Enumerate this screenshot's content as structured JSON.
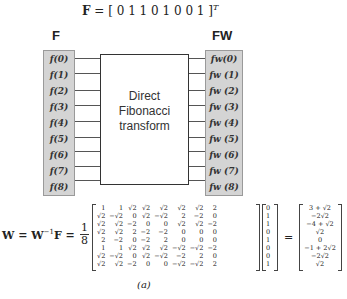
{
  "top_formula": {
    "lhs": "F",
    "eq": " = [ ",
    "values": "0 1 1 0 1 0 0 1",
    "close": " ]",
    "superscript": "T"
  },
  "left_column": {
    "label": "F",
    "cells": [
      "f(0)",
      "f(1)",
      "f(2)",
      "f(3)",
      "f(4)",
      "f(5)",
      "f(6)",
      "f(7)",
      "f(8)"
    ]
  },
  "right_column": {
    "label": "FW",
    "cells": [
      "fw(0)",
      "fw (1)",
      "fw (2)",
      "fw (3)",
      "fw (4)",
      "fw (5)",
      "fw (6)",
      "fw (7)",
      "fw (8)"
    ]
  },
  "transform_box": {
    "lines": [
      "Direct",
      "Fibonacci",
      "transform"
    ]
  },
  "equation": {
    "lhs": "W = W",
    "inv": "−1",
    "mid": "F =",
    "frac_num": "1",
    "frac_den": "8",
    "equals": "=",
    "matrix": [
      [
        "1",
        "1",
        "√2",
        "√2",
        "√2",
        "√2",
        "√2",
        "2"
      ],
      [
        "√2",
        "−√2",
        "0",
        "√2",
        "−√2",
        "2",
        "−2",
        "0"
      ],
      [
        "√2",
        "√2",
        "−2",
        "0",
        "0",
        "√2",
        "√2",
        "−2"
      ],
      [
        "√2",
        "√2",
        "2",
        "−2",
        "−2",
        "0",
        "0",
        "0"
      ],
      [
        "2",
        "−2",
        "0",
        "−2",
        "2",
        "0",
        "0",
        "0"
      ],
      [
        "1",
        "1",
        "√2",
        "√2",
        "√2",
        "−√2",
        "−√2",
        "−2"
      ],
      [
        "√2",
        "−√2",
        "0",
        "√2",
        "−√2",
        "−2",
        "2",
        "0"
      ],
      [
        "√2",
        "√2",
        "−2",
        "0",
        "0",
        "−√2",
        "−√2",
        "2"
      ]
    ],
    "input_vector": [
      "0",
      "1",
      "1",
      "0",
      "1",
      "0",
      "0",
      "1"
    ],
    "result_vector": [
      "3 + √2",
      "−2√2",
      "−4 + √2",
      "√2",
      "0",
      "−1 + 2√2",
      "−2√2",
      "√2"
    ]
  },
  "caption": "(a)"
}
